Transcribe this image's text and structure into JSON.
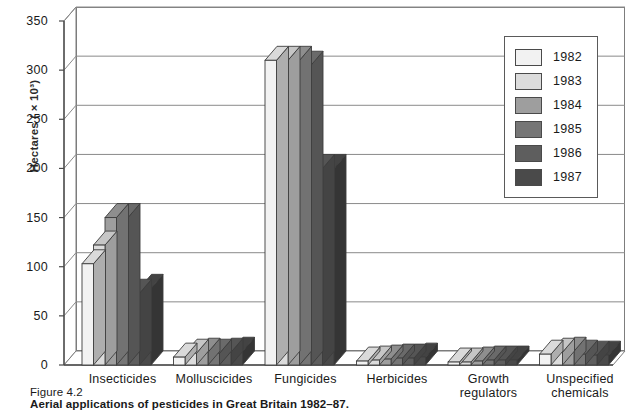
{
  "figure": {
    "number": "Figure 4.2",
    "title": "Aerial applications of pesticides in Great Britain 1982–87."
  },
  "chart_data": {
    "type": "bar",
    "title": "Aerial applications of pesticides in Great Britain 1982–87.",
    "xlabel": "",
    "ylabel": "Hectares ( × 10³)",
    "ylim": [
      0,
      350
    ],
    "yticks": [
      0,
      50,
      100,
      150,
      200,
      250,
      300,
      350
    ],
    "grid": true,
    "legend_position": "top-right",
    "categories": [
      "Insecticides",
      "Molluscicides",
      "Fungicides",
      "Herbicides",
      "Growth regulators",
      "Unspecified chemicals"
    ],
    "series": [
      {
        "name": "1982",
        "color": "#f2f2f2",
        "values": [
          103,
          8,
          310,
          4,
          3,
          11
        ]
      },
      {
        "name": "1983",
        "color": "#dcdcdc",
        "values": [
          122,
          12,
          310,
          5,
          3,
          13
        ]
      },
      {
        "name": "1984",
        "color": "#9e9e9e",
        "values": [
          150,
          13,
          310,
          6,
          4,
          14
        ]
      },
      {
        "name": "1985",
        "color": "#767676",
        "values": [
          150,
          12,
          305,
          7,
          5,
          11
        ]
      },
      {
        "name": "1986",
        "color": "#5e5e5e",
        "values": [
          73,
          13,
          200,
          7,
          5,
          10
        ]
      },
      {
        "name": "1987",
        "color": "#4a4a4a",
        "values": [
          78,
          14,
          200,
          8,
          5,
          10
        ]
      }
    ]
  },
  "legend": {
    "items": [
      {
        "label": "1982"
      },
      {
        "label": "1983"
      },
      {
        "label": "1984"
      },
      {
        "label": "1985"
      },
      {
        "label": "1986"
      },
      {
        "label": "1987"
      }
    ]
  }
}
